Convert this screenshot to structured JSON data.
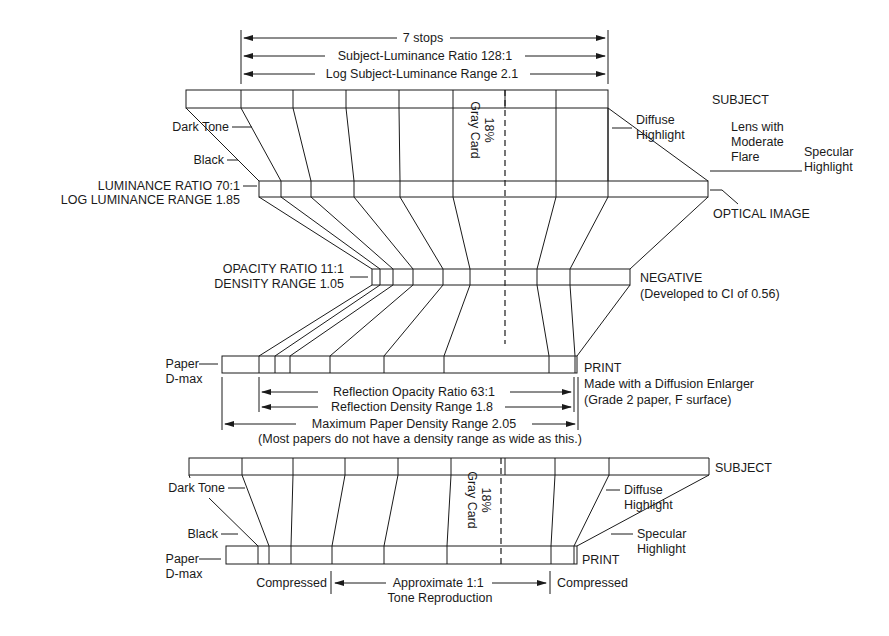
{
  "top_diagram": {
    "dimensions": {
      "stops": "7 stops",
      "ratio": "Subject-Luminance Ratio 128:1",
      "log_range": "Log Subject-Luminance Range 2.1"
    },
    "subject_label": "SUBJECT",
    "dark_tone_label": "Dark Tone",
    "black_label": "Black",
    "gray_card_pct": "18%",
    "gray_card_label": "Gray Card",
    "diffuse_highlight": [
      "Diffuse",
      "Highlight"
    ],
    "lens_flare": [
      "Lens with",
      "Moderate",
      "Flare"
    ],
    "specular_highlight": [
      "Specular",
      "Highlight"
    ],
    "luminance_ratio": "LUMINANCE RATIO 70:1",
    "log_luminance_range": "LOG LUMINANCE RANGE 1.85",
    "optical_image_label": "OPTICAL IMAGE",
    "opacity_ratio": "OPACITY RATIO 11:1",
    "density_range": "DENSITY RANGE 1.05",
    "negative_label": "NEGATIVE",
    "negative_note": "(Developed to CI of 0.56)",
    "paper_dmax": [
      "Paper",
      "D-max"
    ],
    "print_label": "PRINT",
    "print_note_1": "Made with a Diffusion Enlarger",
    "print_note_2": "(Grade 2 paper, F surface)",
    "reflection_opacity": "Reflection Opacity Ratio 63:1",
    "reflection_density": "Reflection Density Range 1.8",
    "max_paper_density": "Maximum Paper Density Range 2.05",
    "paper_note": "(Most papers do not have a density range as wide as this.)"
  },
  "bottom_diagram": {
    "subject_label": "SUBJECT",
    "dark_tone_label": "Dark Tone",
    "black_label": "Black",
    "gray_card_pct": "18%",
    "gray_card_label": "Gray Card",
    "diffuse_highlight": [
      "Diffuse",
      "Highlight"
    ],
    "specular_highlight": [
      "Specular",
      "Highlight"
    ],
    "paper_dmax": [
      "Paper",
      "D-max"
    ],
    "print_label": "PRINT",
    "compressed_left": "Compressed",
    "compressed_right": "Compressed",
    "reproduction": [
      "Approximate 1:1",
      "Tone Reproduction"
    ]
  }
}
